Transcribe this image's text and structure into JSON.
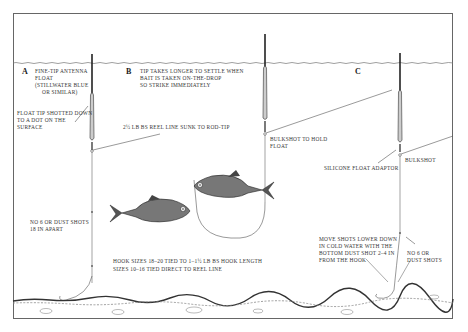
{
  "diagram": {
    "panels": [
      {
        "letter": "A",
        "notes": [
          "Fine-tip antenna",
          "float",
          "(Stillwater Blue",
          "or similar)"
        ],
        "float_note": [
          "Float tip shotted down",
          "to a dot on the",
          "surface"
        ],
        "shot_note": [
          "No 6 or dust shots",
          "18 in apart"
        ]
      },
      {
        "letter": "B",
        "notes": [
          "Tip takes longer to settle when",
          "bait is taken on-the-drop",
          "so strike immediately"
        ],
        "line_note": "2½ lb bs reel line sunk to rod-tip",
        "bulk_note": [
          "Bulkshot to hold",
          "float"
        ],
        "hook_note": [
          "Hook sizes 18–20 tied to 1–1½ lb bs hook length",
          "sizes 10–16 tied direct to reel line"
        ]
      },
      {
        "letter": "C",
        "adaptor_note": "Silicone float adaptor",
        "bulk_note": "Bulkshot",
        "move_note": [
          "Move shots lower down",
          "in cold water with the",
          "bottom dust shot 2–4 in",
          "from the hook"
        ],
        "shot_note": [
          "No 6 or",
          "dust shots"
        ]
      }
    ],
    "colors": {
      "ink": "#222222",
      "frame": "#666666",
      "line": "#555555",
      "background": "#ffffff"
    }
  }
}
